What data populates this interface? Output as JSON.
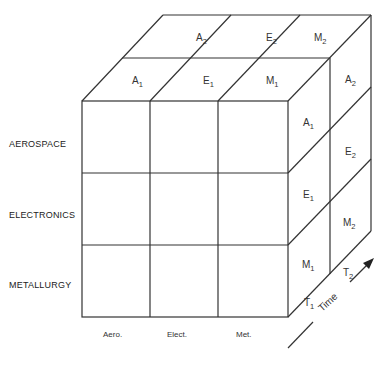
{
  "diagram": {
    "type": "3d-matrix-cube",
    "rows": [
      {
        "label": "AEROSPACE"
      },
      {
        "label": "ELECTRONICS"
      },
      {
        "label": "METALLURGY"
      }
    ],
    "columns": [
      {
        "label": "Aero."
      },
      {
        "label": "Elect."
      },
      {
        "label": "Met."
      }
    ],
    "top_face": {
      "back_row": [
        {
          "letter": "A",
          "sub": "2"
        },
        {
          "letter": "E",
          "sub": "2"
        },
        {
          "letter": "M",
          "sub": "2"
        }
      ],
      "front_row": [
        {
          "letter": "A",
          "sub": "1"
        },
        {
          "letter": "E",
          "sub": "1"
        },
        {
          "letter": "M",
          "sub": "1"
        }
      ]
    },
    "side_face": {
      "front_column": [
        {
          "letter": "A",
          "sub": "1"
        },
        {
          "letter": "E",
          "sub": "1"
        },
        {
          "letter": "M",
          "sub": "1"
        }
      ],
      "back_column": [
        {
          "letter": "A",
          "sub": "2"
        },
        {
          "letter": "E",
          "sub": "2"
        },
        {
          "letter": "M",
          "sub": "2"
        }
      ]
    },
    "depth_axis": {
      "label": "Time",
      "ticks": [
        {
          "letter": "T",
          "sub": "1"
        },
        {
          "letter": "T",
          "sub": "2"
        }
      ]
    },
    "line_color": "#333333"
  }
}
